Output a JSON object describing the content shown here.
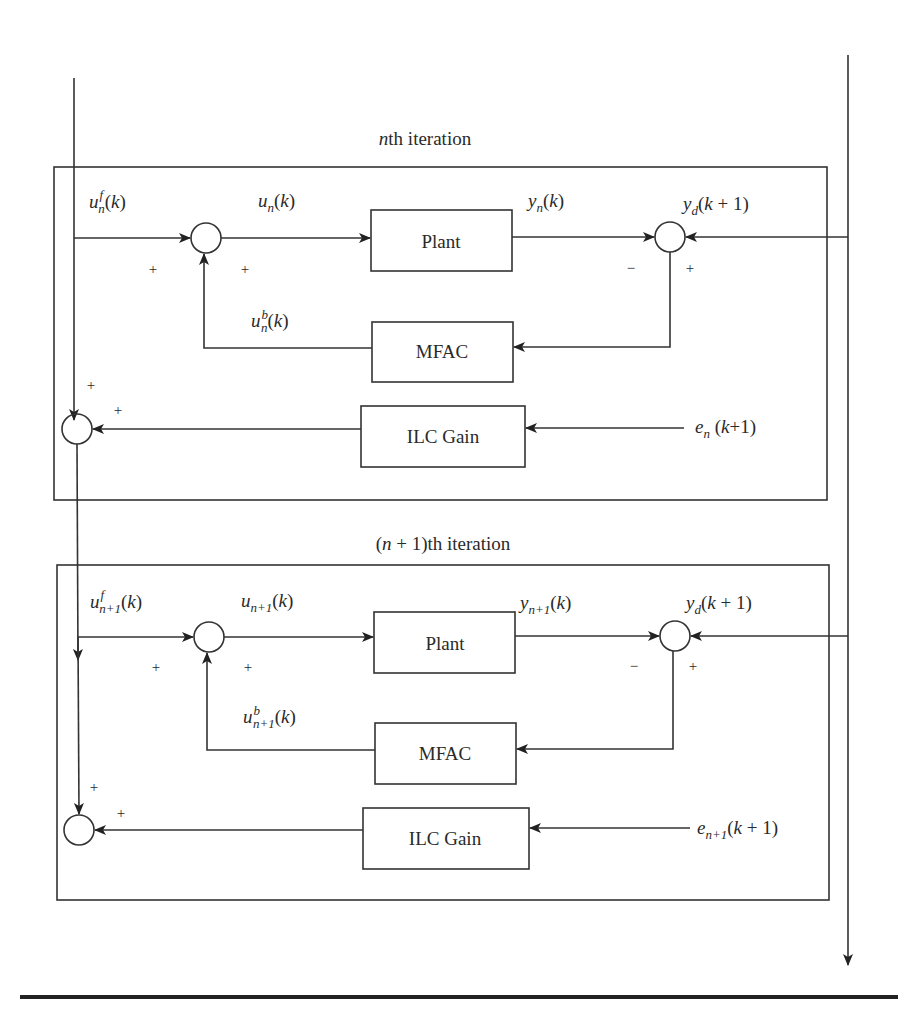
{
  "diagram": {
    "type": "block-diagram",
    "iterations": [
      {
        "title": "nth iteration",
        "title_italic": "n",
        "title_rest": "th iteration",
        "blocks": {
          "plant": "Plant",
          "mfac": "MFAC",
          "ilc": "ILC Gain"
        },
        "signals": {
          "uf": {
            "base": "u",
            "sup": "f",
            "sub": "n",
            "arg": "(k)"
          },
          "u": {
            "base": "u",
            "sub": "n",
            "arg": "(k)"
          },
          "y": {
            "base": "y",
            "sub": "n",
            "arg": "(k)"
          },
          "yd": {
            "base": "y",
            "sub": "d",
            "arg": "(k + 1)"
          },
          "ub": {
            "base": "u",
            "sup": "b",
            "sub": "n",
            "arg": "(k)"
          },
          "e": {
            "base": "e",
            "sub": "n",
            "arg": " (k+1)"
          }
        },
        "signs": {
          "sum1_left": "+",
          "sum1_bottom": "+",
          "sum2_left": "−",
          "sum2_right": "+",
          "sum3_top": "+",
          "sum3_right": "+"
        }
      },
      {
        "title": "(n + 1)th iteration",
        "title_pre": "(",
        "title_italic": "n",
        "title_rest": " + 1)th iteration",
        "blocks": {
          "plant": "Plant",
          "mfac": "MFAC",
          "ilc": "ILC Gain"
        },
        "signals": {
          "uf": {
            "base": "u",
            "sup": "f",
            "sub": "n+1",
            "arg": "(k)"
          },
          "u": {
            "base": "u",
            "sub": "n+1",
            "arg": "(k)"
          },
          "y": {
            "base": "y",
            "sub": "n+1",
            "arg": "(k)"
          },
          "yd": {
            "base": "y",
            "sub": "d",
            "arg": "(k + 1)"
          },
          "ub": {
            "base": "u",
            "sup": "b",
            "sub": "n+1",
            "arg": "(k)"
          },
          "e": {
            "base": "e",
            "sub": "n+1",
            "arg": "(k + 1)"
          }
        },
        "signs": {
          "sum1_left": "+",
          "sum1_bottom": "+",
          "sum2_left": "−",
          "sum2_right": "+",
          "sum3_top": "+",
          "sum3_right": "+"
        }
      }
    ],
    "colors": {
      "stroke": "#333333",
      "text": "#2a2a2a",
      "background": "#ffffff"
    }
  }
}
